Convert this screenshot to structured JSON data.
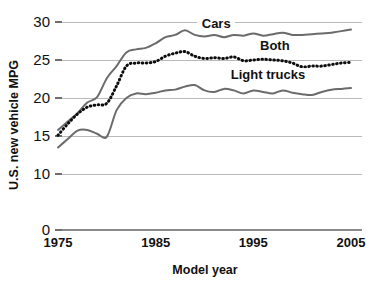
{
  "chart_data": {
    "type": "line",
    "title": "",
    "xlabel": "Model year",
    "ylabel": "U.S. new vehicle MPG",
    "xlim": [
      1975,
      2005
    ],
    "ylim": [
      0,
      30
    ],
    "grid": true,
    "legend_position": "inline-annotations",
    "y_ticks": [
      0,
      10,
      15,
      20,
      25,
      30
    ],
    "y_tick_labels": [
      "0",
      "10",
      "15",
      "20",
      "25",
      "30"
    ],
    "x_ticks": [
      1975,
      1985,
      1995,
      2005
    ],
    "x_tick_labels": [
      "1975",
      "1985",
      "1995",
      "2005"
    ],
    "x": [
      1975,
      1976,
      1977,
      1978,
      1979,
      1980,
      1981,
      1982,
      1983,
      1984,
      1985,
      1986,
      1987,
      1988,
      1989,
      1990,
      1991,
      1992,
      1993,
      1994,
      1995,
      1996,
      1997,
      1998,
      1999,
      2000,
      2001,
      2002,
      2003,
      2004,
      2005
    ],
    "series": [
      {
        "name": "Cars",
        "style": "solid",
        "color": "#6b6b6b",
        "label_x": 1991.2,
        "label_y": 29.3,
        "values": [
          15.8,
          16.9,
          18.0,
          19.4,
          20.1,
          22.6,
          24.2,
          26.0,
          26.4,
          26.6,
          27.2,
          28.0,
          28.3,
          28.9,
          28.3,
          28.1,
          28.3,
          28.0,
          28.3,
          28.2,
          28.5,
          28.2,
          28.4,
          28.6,
          28.3,
          28.3,
          28.4,
          28.5,
          28.6,
          28.8,
          29.0
        ]
      },
      {
        "name": "Both",
        "style": "dotted",
        "color": "#0d0d0d",
        "label_x": 1997.2,
        "label_y": 26.5,
        "values": [
          15.1,
          16.6,
          17.9,
          18.8,
          19.1,
          19.3,
          21.6,
          24.2,
          24.6,
          24.6,
          24.8,
          25.5,
          25.9,
          26.1,
          25.5,
          25.2,
          25.3,
          25.2,
          25.4,
          24.9,
          25.0,
          25.1,
          25.0,
          24.9,
          24.6,
          24.1,
          24.2,
          24.2,
          24.4,
          24.6,
          24.7
        ]
      },
      {
        "name": "Light trucks",
        "style": "solid",
        "color": "#6b6b6b",
        "label_x": 1996.5,
        "label_y": 22.6,
        "values": [
          13.5,
          14.6,
          15.7,
          15.8,
          15.3,
          14.9,
          18.4,
          20.0,
          20.6,
          20.5,
          20.7,
          21.0,
          21.1,
          21.5,
          21.7,
          21.0,
          20.8,
          21.2,
          21.0,
          20.6,
          21.0,
          20.8,
          20.6,
          21.0,
          20.7,
          20.5,
          20.4,
          20.8,
          21.1,
          21.2,
          21.3
        ]
      }
    ]
  },
  "axis_label_texts": {
    "x_title": "Model year",
    "y_title": "U.S. new vehicle MPG"
  }
}
